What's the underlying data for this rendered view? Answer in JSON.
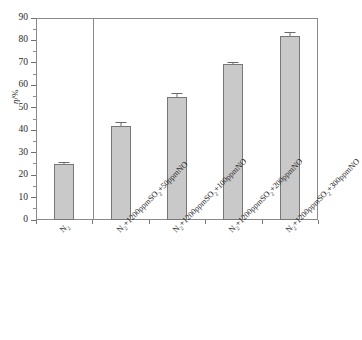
{
  "chart_data": {
    "type": "bar",
    "title": "",
    "subtitle": "",
    "xlabel": "",
    "ylabel": "η/%",
    "ylim": [
      0,
      90
    ],
    "ytick_step": 10,
    "grid": false,
    "legend": "none",
    "categories": [
      "N₂",
      "N₂+1200ppmSO₂+50ppmNO",
      "N₂+1200ppmSO₂+100ppmNO",
      "N₂+1200ppmSO₂+200ppmNO",
      "N₂+1200ppmSO₂+300ppmNO"
    ],
    "values": [
      25,
      42,
      55,
      69.5,
      82
    ],
    "errors": [
      1.0,
      1.5,
      1.5,
      1.0,
      1.8
    ],
    "bar_color": "#c9c9c9",
    "bar_edge_color": "#777777",
    "axis_color": "#8a8a8a",
    "error_bar_color": "#6a6a6a",
    "annotations": [
      "group divider line after first category"
    ]
  },
  "axis": {
    "y_ticks": [
      "0",
      "10",
      "20",
      "30",
      "40",
      "50",
      "60",
      "70",
      "80",
      "90"
    ],
    "y_title_symbol": "η",
    "y_title_unit": "/%"
  },
  "categories_rich": [
    {
      "pre": "N",
      "sub1": "2",
      "mid": "",
      "sub2": "",
      "post": ""
    },
    {
      "pre": "N",
      "sub1": "2",
      "mid": "+1200ppmSO",
      "sub2": "2",
      "post": "+50ppmNO"
    },
    {
      "pre": "N",
      "sub1": "2",
      "mid": "+1200ppmSO",
      "sub2": "2",
      "post": "+100ppmNO"
    },
    {
      "pre": "N",
      "sub1": "2",
      "mid": "+1200ppmSO",
      "sub2": "2",
      "post": "+200ppmNO"
    },
    {
      "pre": "N",
      "sub1": "2",
      "mid": "+1200ppmSO",
      "sub2": "2",
      "post": "+300ppmNO"
    }
  ]
}
